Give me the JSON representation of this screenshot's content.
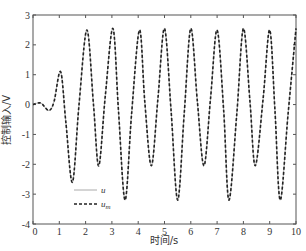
{
  "chart_data": {
    "type": "line",
    "title": "",
    "xlabel": "时间/s",
    "ylabel": "控制输入/V",
    "xlim": [
      0,
      10
    ],
    "ylim": [
      -4,
      3
    ],
    "xticks": [
      0,
      1,
      2,
      3,
      4,
      5,
      6,
      7,
      8,
      9,
      10
    ],
    "yticks": [
      -4,
      -3,
      -2,
      -1,
      0,
      1,
      2,
      3
    ],
    "grid": false,
    "legend_position": "lower-left",
    "series": [
      {
        "name": "u",
        "style": "solid",
        "color": "#aaaaaa",
        "x": [
          0,
          0.3,
          0.6,
          0.8,
          1.05,
          1.25,
          1.5,
          1.75,
          2.05,
          2.3,
          2.5,
          2.75,
          3.04,
          3.25,
          3.5,
          3.75,
          4.05,
          4.25,
          4.5,
          4.75,
          5.0,
          5.25,
          5.5,
          5.75,
          6.0,
          6.25,
          6.5,
          6.75,
          7.0,
          7.25,
          7.45,
          7.75,
          8.0,
          8.25,
          8.45,
          8.75,
          9.0,
          9.2,
          9.4,
          9.7,
          10.0
        ],
        "y": [
          0,
          0.05,
          -0.2,
          0.1,
          1.1,
          -0.6,
          -2.6,
          0.0,
          2.5,
          0.0,
          -2.05,
          0.3,
          2.55,
          -0.2,
          -3.2,
          -0.3,
          2.5,
          0.1,
          -2.05,
          0.2,
          2.55,
          -0.2,
          -3.2,
          -0.3,
          2.55,
          0.1,
          -2.05,
          0.2,
          2.5,
          -0.2,
          -3.2,
          -0.3,
          2.55,
          0.1,
          -2.05,
          0.2,
          2.5,
          -0.2,
          -3.2,
          -0.3,
          2.55
        ]
      },
      {
        "name": "u_m",
        "style": "dashed",
        "color": "#222222",
        "x": [
          0,
          0.3,
          0.6,
          0.8,
          1.05,
          1.25,
          1.5,
          1.75,
          2.05,
          2.3,
          2.5,
          2.75,
          3.04,
          3.25,
          3.5,
          3.75,
          4.05,
          4.25,
          4.5,
          4.75,
          5.0,
          5.25,
          5.5,
          5.75,
          6.0,
          6.25,
          6.5,
          6.75,
          7.0,
          7.25,
          7.45,
          7.75,
          8.0,
          8.25,
          8.45,
          8.75,
          9.0,
          9.2,
          9.4,
          9.7,
          10.0
        ],
        "y": [
          0,
          0.05,
          -0.2,
          0.1,
          1.1,
          -0.6,
          -2.6,
          0.0,
          2.5,
          0.0,
          -2.05,
          0.3,
          2.55,
          -0.2,
          -3.2,
          -0.3,
          2.5,
          0.1,
          -2.05,
          0.2,
          2.55,
          -0.2,
          -3.2,
          -0.3,
          2.55,
          0.1,
          -2.05,
          0.2,
          2.5,
          -0.2,
          -3.2,
          -0.3,
          2.55,
          0.1,
          -2.05,
          0.2,
          2.5,
          -0.2,
          -3.2,
          -0.3,
          2.55
        ]
      }
    ],
    "legend": [
      {
        "label": "u",
        "sub": "",
        "style": "solid"
      },
      {
        "label": "u",
        "sub": "m",
        "style": "dashed"
      }
    ]
  },
  "layout": {
    "plot": {
      "left": 33,
      "top": 15,
      "right": 296,
      "bottom": 224
    }
  }
}
